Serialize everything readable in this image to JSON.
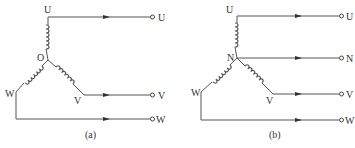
{
  "figure": {
    "panels": [
      {
        "id": "a",
        "caption": "(a)",
        "center_node_label": "O",
        "winding_labels": {
          "U": "U",
          "V": "V",
          "W": "W"
        },
        "terminals": [
          "U",
          "V",
          "W"
        ],
        "description": "Star (Y) connection, three-phase three-wire"
      },
      {
        "id": "b",
        "caption": "(b)",
        "center_node_label": "N",
        "winding_labels": {
          "U": "U",
          "V": "V",
          "W": "W"
        },
        "terminals": [
          "U",
          "N",
          "V",
          "W"
        ],
        "description": "Star (Y) connection, three-phase four-wire with neutral"
      }
    ]
  },
  "colors": {
    "line": "#555555",
    "text": "#333333",
    "background": "#ffffff"
  }
}
